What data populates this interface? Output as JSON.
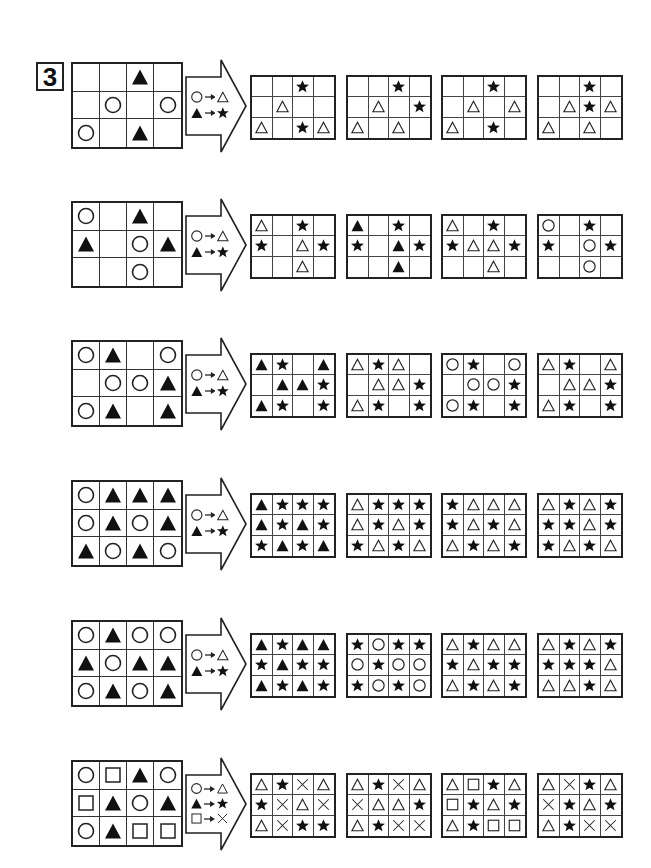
{
  "question_number": "3",
  "legend_symbols": {
    "circle": "white circle",
    "triangle_open": "white triangle",
    "triangle_filled": "black triangle",
    "star": "black star",
    "square": "white square",
    "cross": "x mark"
  },
  "rows": [
    {
      "source": [
        [
          "",
          "",
          "T",
          ""
        ],
        [
          "",
          "O",
          "",
          "O"
        ],
        [
          "O",
          "",
          "T",
          ""
        ]
      ],
      "rules": [
        [
          "O",
          "t"
        ],
        [
          "T",
          "S"
        ]
      ],
      "options": [
        [
          [
            "",
            "",
            "S",
            ""
          ],
          [
            "",
            "t",
            "",
            ""
          ],
          [
            "t",
            "",
            "S",
            "t"
          ]
        ],
        [
          [
            "",
            "",
            "S",
            ""
          ],
          [
            "",
            "t",
            "",
            "S"
          ],
          [
            "t",
            "",
            "t",
            ""
          ]
        ],
        [
          [
            "",
            "",
            "S",
            ""
          ],
          [
            "",
            "t",
            "",
            "t"
          ],
          [
            "t",
            "",
            "S",
            ""
          ]
        ],
        [
          [
            "",
            "",
            "S",
            ""
          ],
          [
            "",
            "t",
            "S",
            "t"
          ],
          [
            "t",
            "",
            "t",
            ""
          ]
        ]
      ]
    },
    {
      "source": [
        [
          "O",
          "",
          "T",
          ""
        ],
        [
          "T",
          "",
          "O",
          "T"
        ],
        [
          "",
          "",
          "O",
          ""
        ]
      ],
      "rules": [
        [
          "O",
          "t"
        ],
        [
          "T",
          "S"
        ]
      ],
      "options": [
        [
          [
            "t",
            "",
            "S",
            ""
          ],
          [
            "S",
            "",
            "t",
            "S"
          ],
          [
            "",
            "",
            "t",
            ""
          ]
        ],
        [
          [
            "T",
            "",
            "S",
            ""
          ],
          [
            "S",
            "",
            "T",
            "S"
          ],
          [
            "",
            "",
            "T",
            ""
          ]
        ],
        [
          [
            "t",
            "",
            "S",
            ""
          ],
          [
            "S",
            "t",
            "t",
            "S"
          ],
          [
            "",
            "",
            "t",
            ""
          ]
        ],
        [
          [
            "O",
            "",
            "S",
            ""
          ],
          [
            "S",
            "",
            "O",
            "S"
          ],
          [
            "",
            "",
            "O",
            ""
          ]
        ]
      ]
    },
    {
      "source": [
        [
          "O",
          "T",
          "",
          "O"
        ],
        [
          "",
          "O",
          "O",
          "T"
        ],
        [
          "O",
          "T",
          "",
          "T"
        ]
      ],
      "rules": [
        [
          "O",
          "t"
        ],
        [
          "T",
          "S"
        ]
      ],
      "options": [
        [
          [
            "T",
            "S",
            "",
            "T"
          ],
          [
            "",
            "T",
            "T",
            "S"
          ],
          [
            "T",
            "S",
            "",
            "S"
          ]
        ],
        [
          [
            "t",
            "S",
            "t",
            ""
          ],
          [
            "",
            "t",
            "t",
            "S"
          ],
          [
            "t",
            "S",
            "",
            "S"
          ]
        ],
        [
          [
            "O",
            "S",
            "",
            "O"
          ],
          [
            "",
            "O",
            "O",
            "S"
          ],
          [
            "O",
            "S",
            "",
            "S"
          ]
        ],
        [
          [
            "t",
            "S",
            "",
            "t"
          ],
          [
            "",
            "t",
            "t",
            "S"
          ],
          [
            "t",
            "S",
            "",
            "S"
          ]
        ]
      ]
    },
    {
      "source": [
        [
          "O",
          "T",
          "T",
          "T"
        ],
        [
          "O",
          "T",
          "O",
          "T"
        ],
        [
          "T",
          "O",
          "T",
          "O"
        ]
      ],
      "rules": [
        [
          "O",
          "t"
        ],
        [
          "T",
          "S"
        ]
      ],
      "options": [
        [
          [
            "T",
            "S",
            "S",
            "S"
          ],
          [
            "T",
            "S",
            "T",
            "S"
          ],
          [
            "S",
            "T",
            "S",
            "T"
          ]
        ],
        [
          [
            "t",
            "S",
            "S",
            "S"
          ],
          [
            "t",
            "S",
            "t",
            "S"
          ],
          [
            "S",
            "t",
            "S",
            "t"
          ]
        ],
        [
          [
            "S",
            "t",
            "t",
            "t"
          ],
          [
            "S",
            "t",
            "S",
            "t"
          ],
          [
            "t",
            "S",
            "t",
            "S"
          ]
        ],
        [
          [
            "t",
            "S",
            "t",
            "S"
          ],
          [
            "S",
            "S",
            "t",
            "S"
          ],
          [
            "S",
            "t",
            "S",
            "t"
          ]
        ]
      ]
    },
    {
      "source": [
        [
          "O",
          "T",
          "O",
          "O"
        ],
        [
          "T",
          "O",
          "T",
          "T"
        ],
        [
          "O",
          "T",
          "O",
          "T"
        ]
      ],
      "rules": [
        [
          "O",
          "t"
        ],
        [
          "T",
          "S"
        ]
      ],
      "options": [
        [
          [
            "T",
            "S",
            "T",
            "T"
          ],
          [
            "S",
            "T",
            "S",
            "S"
          ],
          [
            "T",
            "S",
            "T",
            "S"
          ]
        ],
        [
          [
            "S",
            "O",
            "S",
            "S"
          ],
          [
            "O",
            "S",
            "O",
            "O"
          ],
          [
            "S",
            "O",
            "S",
            "O"
          ]
        ],
        [
          [
            "t",
            "S",
            "t",
            "t"
          ],
          [
            "S",
            "t",
            "S",
            "S"
          ],
          [
            "t",
            "S",
            "t",
            "S"
          ]
        ],
        [
          [
            "t",
            "S",
            "t",
            "S"
          ],
          [
            "S",
            "S",
            "S",
            "t"
          ],
          [
            "t",
            "t",
            "S",
            "t"
          ]
        ]
      ]
    },
    {
      "source": [
        [
          "O",
          "Q",
          "T",
          "O"
        ],
        [
          "Q",
          "T",
          "O",
          "T"
        ],
        [
          "O",
          "T",
          "Q",
          "Q"
        ]
      ],
      "rules": [
        [
          "O",
          "t"
        ],
        [
          "T",
          "S"
        ],
        [
          "Q",
          "X"
        ]
      ],
      "options": [
        [
          [
            "t",
            "S",
            "X",
            "t"
          ],
          [
            "S",
            "X",
            "t",
            "X"
          ],
          [
            "t",
            "X",
            "S",
            "S"
          ]
        ],
        [
          [
            "t",
            "S",
            "X",
            "t"
          ],
          [
            "X",
            "t",
            "t",
            "S"
          ],
          [
            "t",
            "S",
            "X",
            "X"
          ]
        ],
        [
          [
            "t",
            "Q",
            "S",
            "t"
          ],
          [
            "Q",
            "S",
            "t",
            "S"
          ],
          [
            "t",
            "S",
            "Q",
            "Q"
          ]
        ],
        [
          [
            "t",
            "X",
            "S",
            "t"
          ],
          [
            "X",
            "S",
            "t",
            "S"
          ],
          [
            "t",
            "S",
            "X",
            "X"
          ]
        ]
      ]
    }
  ],
  "symbol_key": {
    "O": "circle",
    "t": "triangle_open",
    "T": "triangle_filled",
    "S": "star",
    "Q": "square",
    "X": "cross"
  }
}
